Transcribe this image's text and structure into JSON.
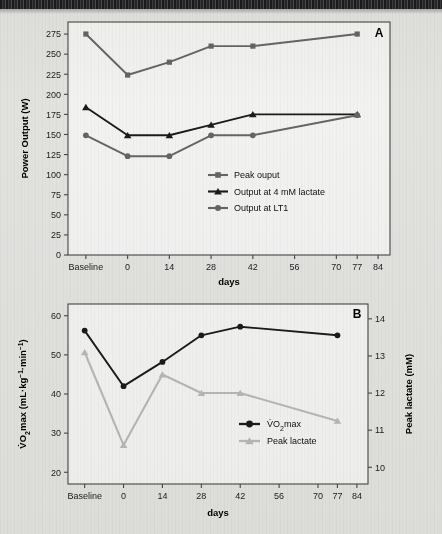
{
  "figure": {
    "panels": [
      {
        "letter": "A",
        "xlabel": "days",
        "ylabel": "Power Output (W)"
      },
      {
        "letter": "B",
        "xlabel": "days",
        "ylabel": "V̇O2max (mL·kg⁻¹·min⁻¹)",
        "ylabel_right": "Peak lactate (mM)"
      }
    ]
  },
  "chart_data": [
    {
      "type": "line",
      "panel": "A",
      "title": "",
      "xlabel": "days",
      "ylabel": "Power Output (W)",
      "x_categories": [
        "Baseline",
        "0",
        "14",
        "28",
        "42",
        "56",
        "70",
        "77",
        "84"
      ],
      "x_tick_values": [
        -14,
        0,
        14,
        28,
        42,
        56,
        70,
        77,
        84
      ],
      "xlim": [
        -20,
        88
      ],
      "ylim": [
        0,
        290
      ],
      "y_ticks": [
        0,
        25,
        50,
        75,
        100,
        125,
        150,
        175,
        200,
        225,
        250,
        275
      ],
      "grid": false,
      "legend_position": "center-right-inside",
      "series": [
        {
          "name": "Peak ouput",
          "marker": "square",
          "color": "#6b6b6b",
          "x": [
            -14,
            0,
            14,
            28,
            42,
            77
          ],
          "values": [
            275,
            224,
            240,
            260,
            260,
            275
          ]
        },
        {
          "name": "Output at 4 mM lactate",
          "marker": "triangle",
          "color": "#1c1c1c",
          "x": [
            -14,
            0,
            14,
            28,
            42,
            77
          ],
          "values": [
            184,
            149,
            149,
            162,
            175,
            175
          ]
        },
        {
          "name": "Output at LT1",
          "marker": "circle",
          "color": "#6b6b6b",
          "x": [
            -14,
            0,
            14,
            28,
            42,
            77
          ],
          "values": [
            149,
            123,
            123,
            149,
            149,
            174
          ]
        }
      ]
    },
    {
      "type": "line",
      "panel": "B",
      "title": "",
      "xlabel": "days",
      "ylabel": "V̇O2max (mL·kg⁻¹·min⁻¹)",
      "ylabel_right": "Peak lactate (mM)",
      "x_categories": [
        "Baseline",
        "0",
        "14",
        "28",
        "42",
        "56",
        "70",
        "77",
        "84"
      ],
      "x_tick_values": [
        -14,
        0,
        14,
        28,
        42,
        56,
        70,
        77,
        84
      ],
      "xlim": [
        -20,
        88
      ],
      "ylim": [
        17,
        63
      ],
      "y_ticks": [
        20,
        30,
        40,
        50,
        60
      ],
      "ylim_right": [
        9.55,
        14.4
      ],
      "y_ticks_right": [
        10,
        11,
        12,
        13,
        14
      ],
      "grid": false,
      "legend_position": "center-right-inside",
      "series": [
        {
          "name": "V̇O2max",
          "axis": "left",
          "marker": "circle",
          "color": "#1c1c1c",
          "x": [
            -14,
            0,
            14,
            28,
            42,
            77
          ],
          "values": [
            56.2,
            42.0,
            48.2,
            55.0,
            57.2,
            55.0
          ]
        },
        {
          "name": "Peak lactate",
          "axis": "right",
          "marker": "triangle",
          "color": "#c2c2c2",
          "x": [
            -14,
            0,
            14,
            28,
            42,
            77
          ],
          "values": [
            13.1,
            10.6,
            12.5,
            12.0,
            12.0,
            11.25
          ]
        }
      ]
    }
  ]
}
